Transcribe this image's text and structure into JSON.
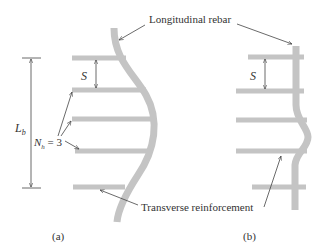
{
  "diagram": {
    "labels": {
      "longitudinal": "Longitudinal rebar",
      "transverse": "Transverse reinforcement",
      "spacing": "S",
      "buckling_length_main": "L",
      "buckling_length_sub": "b",
      "nh_main": "N",
      "nh_sub": "h",
      "nh_value": " = 3",
      "panel_a": "(a)",
      "panel_b": "(b)"
    },
    "colors": {
      "rebar": "#c4c4c4",
      "line": "#444444",
      "text": "#333333"
    }
  }
}
